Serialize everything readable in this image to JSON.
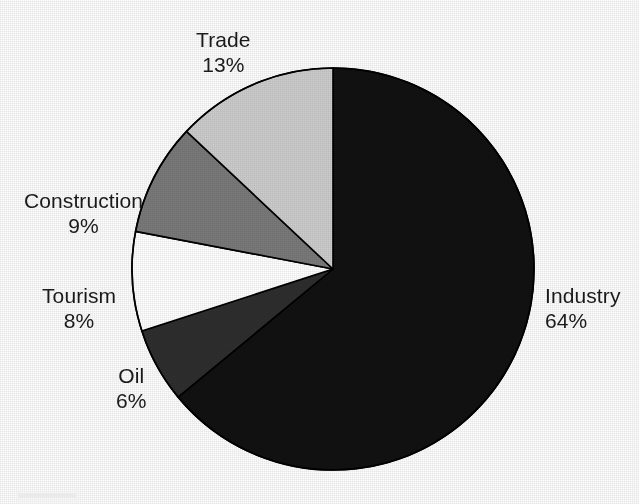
{
  "chart_data": {
    "type": "pie",
    "title": "",
    "subtitle": "",
    "xlabel": "",
    "ylabel": "",
    "legend_position": "none",
    "grid": false,
    "value_unit": "%",
    "start_angle_deg": 0,
    "direction": "clockwise",
    "categories": [
      "Industry",
      "Oil",
      "Tourism",
      "Construction",
      "Trade"
    ],
    "values": [
      64,
      6,
      8,
      9,
      13
    ],
    "slices": [
      {
        "label": "Industry",
        "percent": "64%",
        "value": 64,
        "color": "#111111",
        "stroke": "#000000",
        "start_deg": 0,
        "end_deg": 230.4,
        "label_align": "left"
      },
      {
        "label": "Oil",
        "percent": "6%",
        "value": 6,
        "color": "#2e2e2e",
        "stroke": "#000000",
        "start_deg": 230.4,
        "end_deg": 252.0,
        "label_align": "center"
      },
      {
        "label": "Tourism",
        "percent": "8%",
        "value": 8,
        "color": "#ffffff",
        "stroke": "#000000",
        "start_deg": 252.0,
        "end_deg": 280.8,
        "label_align": "center"
      },
      {
        "label": "Construction",
        "percent": "9%",
        "value": 9,
        "color": "#7a7a7a",
        "stroke": "#000000",
        "start_deg": 280.8,
        "end_deg": 313.2,
        "label_align": "center"
      },
      {
        "label": "Trade",
        "percent": "13%",
        "value": 13,
        "color": "#cdcdcd",
        "stroke": "#000000",
        "start_deg": 313.2,
        "end_deg": 360.0,
        "label_align": "center"
      }
    ],
    "geometry": {
      "center_x": 333,
      "center_y": 269,
      "radius": 201
    },
    "colors": {
      "background": "#fdfdfd",
      "text": "#1a1a1a",
      "outline": "#000000",
      "industry": "#111111",
      "oil": "#2e2e2e",
      "tourism": "#ffffff",
      "construction": "#7a7a7a",
      "trade": "#cdcdcd"
    }
  }
}
